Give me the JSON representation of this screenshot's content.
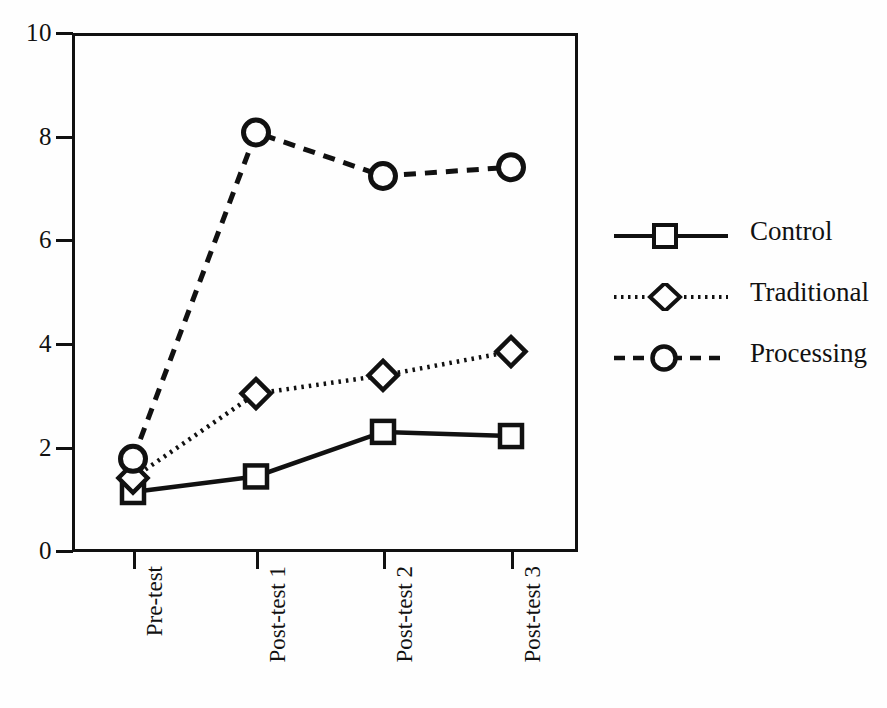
{
  "chart_data": {
    "type": "line",
    "title": "",
    "xlabel": "",
    "ylabel": "",
    "ylim": [
      0,
      10
    ],
    "yticks": [
      0,
      2,
      4,
      6,
      8,
      10
    ],
    "grid": false,
    "legend_position": "right",
    "categories": [
      "Pre-test",
      "Post-test 1",
      "Post-test 2",
      "Post-test 3"
    ],
    "series": [
      {
        "name": "Control",
        "marker": "square",
        "linestyle": "solid",
        "color": "#111111",
        "values": [
          1.12,
          1.42,
          2.28,
          2.2
        ]
      },
      {
        "name": "Traditional",
        "marker": "diamond",
        "linestyle": "dotted",
        "color": "#111111",
        "values": [
          1.39,
          3.02,
          3.37,
          3.83
        ]
      },
      {
        "name": "Processing",
        "marker": "circle",
        "linestyle": "dashed",
        "color": "#111111",
        "values": [
          1.76,
          8.06,
          7.22,
          7.39
        ]
      }
    ]
  },
  "axis": {
    "y_tick_labels": [
      "10",
      "8",
      "6",
      "4",
      "2",
      "0"
    ],
    "x_tick_labels": [
      "Pre-test",
      "Post-test 1",
      "Post-test 2",
      "Post-test 3"
    ]
  },
  "legend": {
    "items": [
      {
        "label": "Control",
        "marker": "square-marker",
        "linestyle": "solid"
      },
      {
        "label": "Traditional",
        "marker": "diamond-marker",
        "linestyle": "dotted"
      },
      {
        "label": "Processing",
        "marker": "circle-marker",
        "linestyle": "dashed"
      }
    ]
  },
  "colors": {
    "ink": "#111111",
    "paper": "#fefefe"
  }
}
